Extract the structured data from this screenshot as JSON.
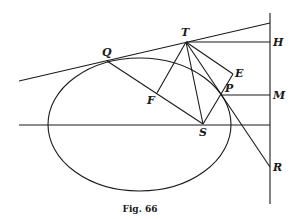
{
  "caption": "Fig. 66",
  "labels": {
    "T": "T",
    "H": "H",
    "Q": "Q",
    "E": "E",
    "P": "P",
    "M": "M",
    "F": "F",
    "S": "S",
    "R": "R"
  },
  "colors": {
    "ink": "#1a1a1a",
    "background": "#ffffff"
  }
}
